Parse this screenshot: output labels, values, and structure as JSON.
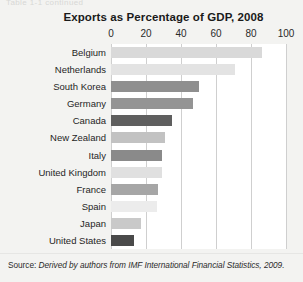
{
  "page": {
    "clipped_header_text": "Table 1-1    continued",
    "source_prefix": "Source:",
    "source_text": "Derived by authors from IMF International Financial Statistics, 2009."
  },
  "chart_data": {
    "type": "bar",
    "orientation": "horizontal",
    "title": "Exports as Percentage of GDP, 2008",
    "xlabel": "",
    "ylabel": "",
    "xlim": [
      0,
      100
    ],
    "xticks": [
      0,
      20,
      40,
      60,
      80,
      100
    ],
    "xtick_labels": [
      "0",
      "20",
      "40",
      "60",
      "80",
      "100"
    ],
    "grid": true,
    "legend": "none",
    "categories": [
      "Belgium",
      "Netherlands",
      "South Korea",
      "Germany",
      "Canada",
      "New Zealand",
      "Italy",
      "United Kingdom",
      "France",
      "Spain",
      "Japan",
      "United States"
    ],
    "values": [
      86,
      71,
      50,
      47,
      35,
      31,
      29,
      29,
      27,
      26,
      17,
      13
    ],
    "bar_colors": [
      "#d9d9d9",
      "#e3e3e3",
      "#8f8f8f",
      "#949494",
      "#5f5f5f",
      "#c2c2c2",
      "#8a8a8a",
      "#e0e0e0",
      "#a6a6a6",
      "#ececec",
      "#c9c9c9",
      "#4a4a4a"
    ],
    "plot_background": "#ffffff",
    "gridline_color": "#cfcfcf"
  }
}
